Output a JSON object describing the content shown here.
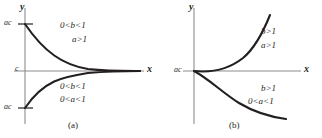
{
  "figure": {
    "width": 322,
    "height": 138,
    "background": "#ffffff",
    "curve_color": "#231f20",
    "axis_color": "#8c8c8c",
    "panels": [
      {
        "id": "a",
        "caption": "(a)",
        "axis_labels": {
          "x": "x",
          "y": "y"
        },
        "tick_labels": {
          "y_top": "ac",
          "y_middle": "c",
          "y_bottom": "ac"
        },
        "regions": [
          {
            "position": "upper",
            "conditions": [
              "0<b<1",
              "a>1"
            ]
          },
          {
            "position": "lower",
            "conditions": [
              "0<b<1",
              "0<a<1"
            ]
          }
        ]
      },
      {
        "id": "b",
        "caption": "(b)",
        "axis_labels": {
          "x": "x",
          "y": "y"
        },
        "tick_labels": {
          "y_origin": "ac"
        },
        "regions": [
          {
            "position": "upper",
            "conditions": [
              "b>1",
              "a>1"
            ]
          },
          {
            "position": "lower",
            "conditions": [
              "b>1",
              "0<a<1"
            ]
          }
        ]
      }
    ]
  }
}
